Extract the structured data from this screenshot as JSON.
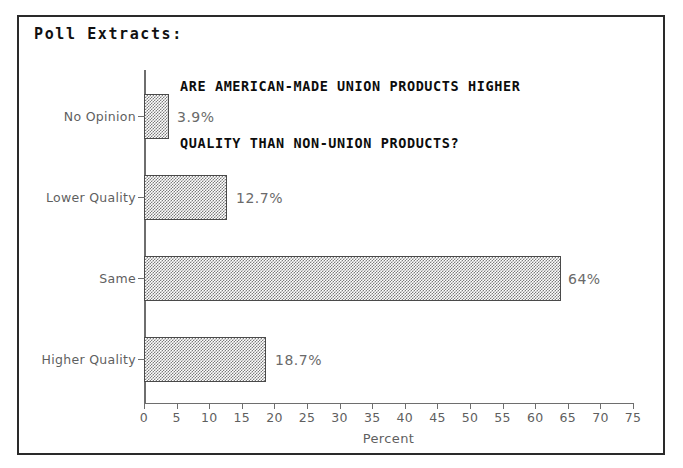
{
  "panel": {
    "caption": "Poll Extracts:"
  },
  "chart_data": {
    "type": "bar",
    "orientation": "horizontal",
    "title": "ARE AMERICAN-MADE UNION PRODUCTS HIGHER QUALITY THAN NON-UNION PRODUCTS?",
    "title_lines": [
      "ARE AMERICAN-MADE UNION PRODUCTS HIGHER",
      "QUALITY THAN NON-UNION PRODUCTS?"
    ],
    "categories": [
      "No Opinion",
      "Lower Quality",
      "Same",
      "Higher Quality"
    ],
    "values": [
      3.9,
      12.7,
      64,
      18.7
    ],
    "value_labels": [
      "3.9%",
      "12.7%",
      "64%",
      "18.7%"
    ],
    "xlabel": "Percent",
    "ylabel": "",
    "xlim": [
      0,
      75
    ],
    "xticks": [
      0,
      5,
      10,
      15,
      20,
      25,
      30,
      35,
      40,
      45,
      50,
      55,
      60,
      65,
      70,
      75
    ],
    "xtick_labels": [
      "0",
      "5",
      "10",
      "15",
      "20",
      "25",
      "30",
      "35",
      "40",
      "45",
      "50",
      "55",
      "60",
      "65",
      "70",
      "75"
    ],
    "grid": false,
    "legend": false,
    "bar_fill": "#7c7c7c",
    "bar_border": "#4a4a4a",
    "axis_color": "#6e6e6e",
    "text_color": "#5f5f5f"
  }
}
